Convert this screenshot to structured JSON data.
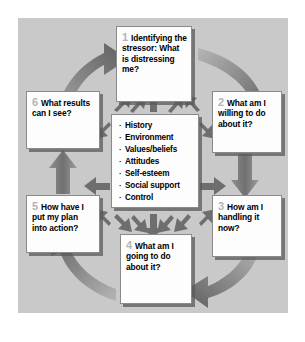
{
  "diagram": {
    "panel_background": "#c9c9c9",
    "page_background": "#ffffff",
    "node_background": "#fdfdfd",
    "arrow_color": "#6e6e6e",
    "number_color": "#b4b4b4",
    "text_color": "#000000",
    "nodes": [
      {
        "id": "1",
        "number": "1",
        "text": "Identifying the stressor: What is distressing me?"
      },
      {
        "id": "2",
        "number": "2",
        "text": "What am I willing to do about it?"
      },
      {
        "id": "3",
        "number": "3",
        "text": "How am I handling it now?"
      },
      {
        "id": "4",
        "number": "4",
        "text": "What am I going to do about it?"
      },
      {
        "id": "5",
        "number": "5",
        "text": "How have I put my plan into action?"
      },
      {
        "id": "6",
        "number": "6",
        "text": "What results can I see?"
      }
    ],
    "center": {
      "bullet_glyph": "·",
      "items": [
        "History",
        "Environment",
        "Values/beliefs",
        "Attitudes",
        "Self-esteem",
        "Social support",
        "Control"
      ]
    },
    "connections": [
      {
        "name": "arrow-6-to-1",
        "style": "curved",
        "from": "6",
        "to": "1"
      },
      {
        "name": "arrow-1-to-2",
        "style": "curved",
        "from": "1",
        "to": "2"
      },
      {
        "name": "arrow-2-to-3",
        "style": "straight",
        "from": "2",
        "to": "3"
      },
      {
        "name": "arrow-3-to-4",
        "style": "curved",
        "from": "3",
        "to": "4"
      },
      {
        "name": "arrow-4-to-5",
        "style": "curved",
        "from": "4",
        "to": "5"
      },
      {
        "name": "arrow-5-to-6",
        "style": "straight",
        "from": "5",
        "to": "6"
      },
      {
        "name": "arrow-center-radiating",
        "style": "radial",
        "from": "center",
        "to": "all"
      }
    ]
  }
}
